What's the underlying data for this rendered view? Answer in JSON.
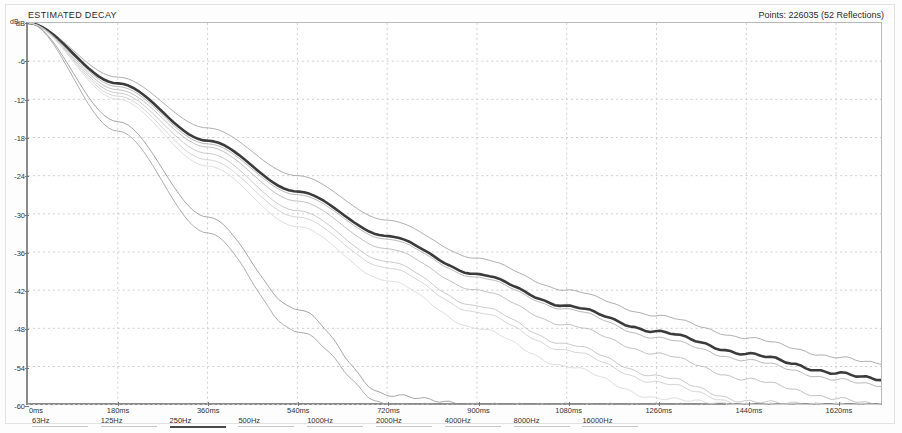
{
  "window": {
    "title": "ESTIMATED DECAY"
  },
  "header": {
    "title": "ESTIMATED DECAY",
    "points_label": "Points: 226035 (52 Reflections)"
  },
  "axes": {
    "y_unit": "dB",
    "y_ticks": [
      "dB",
      "-6",
      "-12",
      "-18",
      "-24",
      "-30",
      "-36",
      "-42",
      "-48",
      "-54",
      "-60"
    ],
    "x_ticks": [
      "0ms",
      "180ms",
      "360ms",
      "540ms",
      "720ms",
      "900ms",
      "1080ms",
      "1260ms",
      "1440ms",
      "1620ms"
    ]
  },
  "frequency_bands": [
    {
      "label": "63Hz",
      "selected": false
    },
    {
      "label": "125Hz",
      "selected": false
    },
    {
      "label": "250Hz",
      "selected": true
    },
    {
      "label": "500Hz",
      "selected": false
    },
    {
      "label": "1000Hz",
      "selected": false
    },
    {
      "label": "2000Hz",
      "selected": false
    },
    {
      "label": "4000Hz",
      "selected": false
    },
    {
      "label": "8000Hz",
      "selected": false
    },
    {
      "label": "16000Hz",
      "selected": false
    }
  ],
  "colors": {
    "background": "#ffffff",
    "axis": "#8a8a8a",
    "grid": "#cfcfcf",
    "text": "#2b2b2b",
    "highlight_curve": "#3b3b3b",
    "selected_rule": "#4a4a4a"
  },
  "chart_data": {
    "type": "line",
    "title": "ESTIMATED DECAY",
    "xlabel": "Time (ms)",
    "ylabel": "dB",
    "xlim": [
      0,
      1710
    ],
    "ylim": [
      -60,
      0
    ],
    "grid": true,
    "legend": "bottom-bands",
    "annotations": [
      "Points: 226035 (52 Reflections)"
    ],
    "x_tick_values": [
      0,
      180,
      360,
      540,
      720,
      900,
      1080,
      1260,
      1440,
      1620
    ],
    "y_tick_values": [
      0,
      -6,
      -12,
      -18,
      -24,
      -30,
      -36,
      -42,
      -48,
      -54,
      -60
    ],
    "series": [
      {
        "name": "63Hz",
        "style": "thin-gray",
        "color": "#9a9a9a",
        "width": 0.8,
        "x": [
          0,
          180,
          360,
          540,
          720,
          900,
          1080,
          1260,
          1440,
          1620,
          1710
        ],
        "values": [
          0,
          -8.5,
          -16.5,
          -24.0,
          -31.0,
          -37.0,
          -42.0,
          -46.0,
          -49.5,
          -52.5,
          -53.5
        ]
      },
      {
        "name": "125Hz",
        "style": "thin-gray",
        "color": "#a8a8a8",
        "width": 0.8,
        "x": [
          0,
          180,
          360,
          540,
          720,
          900,
          1080,
          1260,
          1440,
          1620,
          1710
        ],
        "values": [
          0,
          -10.0,
          -19.0,
          -27.0,
          -34.0,
          -40.0,
          -45.0,
          -49.5,
          -53.0,
          -56.0,
          -57.0
        ]
      },
      {
        "name": "250Hz",
        "style": "bold-dark",
        "color": "#3b3b3b",
        "width": 2.6,
        "x": [
          0,
          180,
          360,
          540,
          720,
          900,
          1080,
          1260,
          1440,
          1620,
          1710
        ],
        "values": [
          0,
          -9.5,
          -18.5,
          -26.5,
          -33.5,
          -39.5,
          -44.5,
          -48.5,
          -52.0,
          -55.0,
          -56.0
        ]
      },
      {
        "name": "500Hz",
        "style": "thin-gray",
        "color": "#b2b2b2",
        "width": 0.8,
        "x": [
          0,
          180,
          360,
          540,
          720,
          900,
          1080,
          1260,
          1440,
          1620,
          1710
        ],
        "values": [
          0,
          -10.5,
          -19.5,
          -28.0,
          -35.5,
          -42.0,
          -47.5,
          -52.0,
          -56.0,
          -59.0,
          -60.0
        ]
      },
      {
        "name": "1000Hz",
        "style": "thin-gray",
        "color": "#bdbdbd",
        "width": 0.8,
        "x": [
          0,
          180,
          360,
          540,
          720,
          900,
          1080,
          1260,
          1440,
          1620,
          1710
        ],
        "values": [
          0,
          -11.0,
          -20.5,
          -29.5,
          -37.5,
          -44.5,
          -50.5,
          -55.5,
          -59.5,
          -60.0,
          -60.0
        ]
      },
      {
        "name": "2000Hz",
        "style": "thin-gray",
        "color": "#8f8f8f",
        "width": 0.8,
        "x": [
          0,
          180,
          360,
          540,
          720,
          900,
          1080,
          1260,
          1440,
          1620,
          1710
        ],
        "values": [
          0,
          -15.5,
          -30.5,
          -45.0,
          -58.5,
          -60.0,
          -60.0,
          -60.0,
          -60.0,
          -60.0,
          -60.0
        ]
      },
      {
        "name": "4000Hz",
        "style": "thin-gray",
        "color": "#999999",
        "width": 0.8,
        "x": [
          0,
          180,
          360,
          540,
          720,
          900,
          1080,
          1260,
          1440,
          1620,
          1710
        ],
        "values": [
          0,
          -17.0,
          -33.0,
          -48.5,
          -60.0,
          -60.0,
          -60.0,
          -60.0,
          -60.0,
          -60.0,
          -60.0
        ]
      },
      {
        "name": "8000Hz",
        "style": "thin-light",
        "color": "#cacaca",
        "width": 0.8,
        "x": [
          0,
          180,
          360,
          540,
          720,
          900,
          1080,
          1260,
          1440,
          1620,
          1710
        ],
        "values": [
          0,
          -11.5,
          -21.5,
          -30.5,
          -38.5,
          -45.5,
          -51.5,
          -56.5,
          -60.0,
          -60.0,
          -60.0
        ]
      },
      {
        "name": "16000Hz",
        "style": "thin-light",
        "color": "#d5d5d5",
        "width": 0.8,
        "x": [
          0,
          180,
          360,
          540,
          720,
          900,
          1080,
          1260,
          1440,
          1620,
          1710
        ],
        "values": [
          0,
          -12.0,
          -22.5,
          -32.0,
          -40.5,
          -48.0,
          -54.0,
          -59.0,
          -60.0,
          -60.0,
          -60.0
        ]
      }
    ]
  }
}
